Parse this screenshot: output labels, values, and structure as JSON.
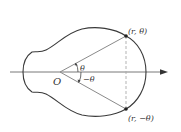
{
  "figure": {
    "colors": {
      "curve": "#3a3a3a",
      "rays": "#8a8a8a",
      "axis": "#6a6a6a",
      "dashed": "#aaaaaa",
      "points": "#222222",
      "text": "#333333"
    },
    "labels": {
      "origin": "O",
      "upper_point": "(r, θ)",
      "lower_point": "(r, −θ)",
      "angle_upper": "θ",
      "angle_lower": "−θ"
    }
  }
}
